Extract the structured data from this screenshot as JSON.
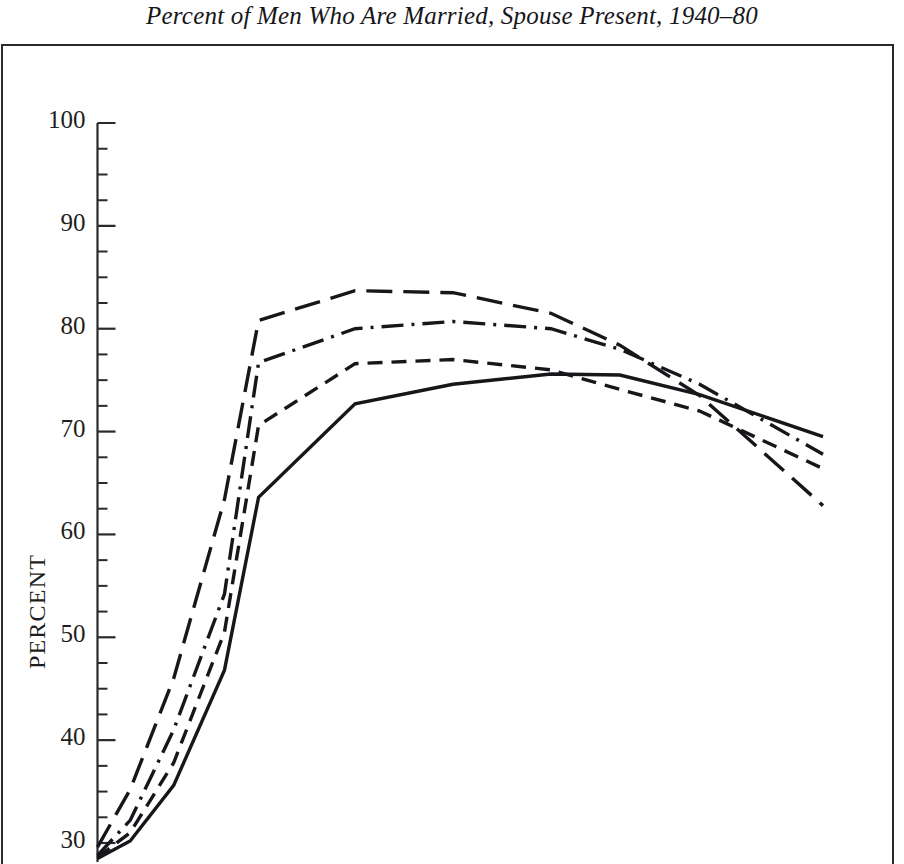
{
  "figure": {
    "title": "Percent of Men Who Are Married, Spouse Present, 1940–80",
    "frame_color": "#2a2a2e",
    "background": "#ffffff",
    "ink_color": "#1a1a1a"
  },
  "axes": {
    "ylabel": "PERCENT",
    "y_major_ticks": [
      100,
      90,
      80,
      70,
      60,
      50,
      40,
      30
    ],
    "y_tick_labels": [
      "100",
      "90",
      "80",
      "70",
      "60",
      "50",
      "40",
      "30"
    ],
    "y_minor_step": 2.5,
    "ylim": [
      28.5,
      101.5
    ],
    "x_axis_visible": false
  },
  "chart_data": {
    "type": "line",
    "title": "Percent of Men Who Are Married, Spouse Present, 1940–80",
    "xlabel": "",
    "ylabel": "PERCENT",
    "ylim": [
      28.5,
      101.5
    ],
    "grid": false,
    "legend": "none",
    "note": "Four unlabeled series distinguished only by line dash pattern; x axis is cropped out of the screenshot so x values are expressed as relative plot positions (0 = left axis, 1 = right end of curves).",
    "x": [
      0.0,
      0.045,
      0.105,
      0.175,
      0.222,
      0.355,
      0.49,
      0.625,
      0.72,
      0.83,
      1.0
    ],
    "series": [
      {
        "name": "series-long-dash",
        "style": "long-dash",
        "values": [
          29.6,
          35.2,
          46.0,
          63.4,
          80.8,
          83.7,
          83.5,
          81.5,
          78.4,
          73.5,
          62.8
        ]
      },
      {
        "name": "series-dash-dot",
        "style": "dash-dot",
        "values": [
          28.8,
          32.2,
          41.0,
          54.2,
          76.7,
          80.0,
          80.7,
          80.0,
          78.0,
          74.6,
          67.8
        ]
      },
      {
        "name": "series-short-dash",
        "style": "short-dash",
        "values": [
          28.6,
          31.0,
          37.8,
          50.5,
          70.6,
          76.6,
          77.0,
          76.0,
          74.1,
          72.0,
          66.4
        ]
      },
      {
        "name": "series-solid",
        "style": "solid",
        "values": [
          28.5,
          30.2,
          35.6,
          46.8,
          63.6,
          72.7,
          74.6,
          75.6,
          75.5,
          73.6,
          69.5
        ]
      }
    ]
  }
}
